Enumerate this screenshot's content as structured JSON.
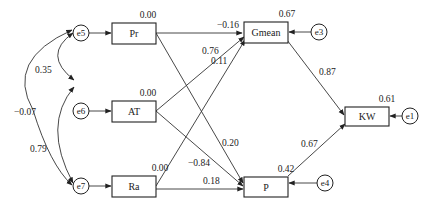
{
  "diagram": {
    "type": "path-model",
    "observed_variables": [
      {
        "id": "Pr",
        "label": "Pr",
        "r2": "0.00"
      },
      {
        "id": "AT",
        "label": "AT",
        "r2": "0.00"
      },
      {
        "id": "Ra",
        "label": "Ra",
        "r2": "0.00"
      },
      {
        "id": "Gmean",
        "label": "Gmean",
        "r2": "0.67"
      },
      {
        "id": "P",
        "label": "P",
        "r2": "0.42"
      },
      {
        "id": "KW",
        "label": "KW",
        "r2": "0.61"
      }
    ],
    "error_terms": [
      {
        "id": "e1",
        "label": "e1",
        "target": "KW"
      },
      {
        "id": "e3",
        "label": "e3",
        "target": "Gmean"
      },
      {
        "id": "e4",
        "label": "e4",
        "target": "P"
      },
      {
        "id": "e5",
        "label": "e5",
        "target": "Pr"
      },
      {
        "id": "e6",
        "label": "e6",
        "target": "AT"
      },
      {
        "id": "e7",
        "label": "e7",
        "target": "Ra"
      }
    ],
    "paths": [
      {
        "from": "Pr",
        "to": "Gmean",
        "coef": "−0.16"
      },
      {
        "from": "Pr",
        "to": "P",
        "coef": "0.20"
      },
      {
        "from": "AT",
        "to": "Gmean",
        "coef": "0.76"
      },
      {
        "from": "AT",
        "to": "P",
        "coef": "−0.84"
      },
      {
        "from": "Ra",
        "to": "Gmean",
        "coef": "0.11"
      },
      {
        "from": "Ra",
        "to": "P",
        "coef": "0.18"
      },
      {
        "from": "Gmean",
        "to": "KW",
        "coef": "0.87"
      },
      {
        "from": "P",
        "to": "KW",
        "coef": "0.67"
      }
    ],
    "covariances": [
      {
        "between": [
          "e5",
          "e6"
        ],
        "coef": "0.35"
      },
      {
        "between": [
          "e6",
          "e7"
        ],
        "coef": "0.79"
      },
      {
        "between": [
          "e5",
          "e7"
        ],
        "coef": "−0.07"
      }
    ]
  }
}
